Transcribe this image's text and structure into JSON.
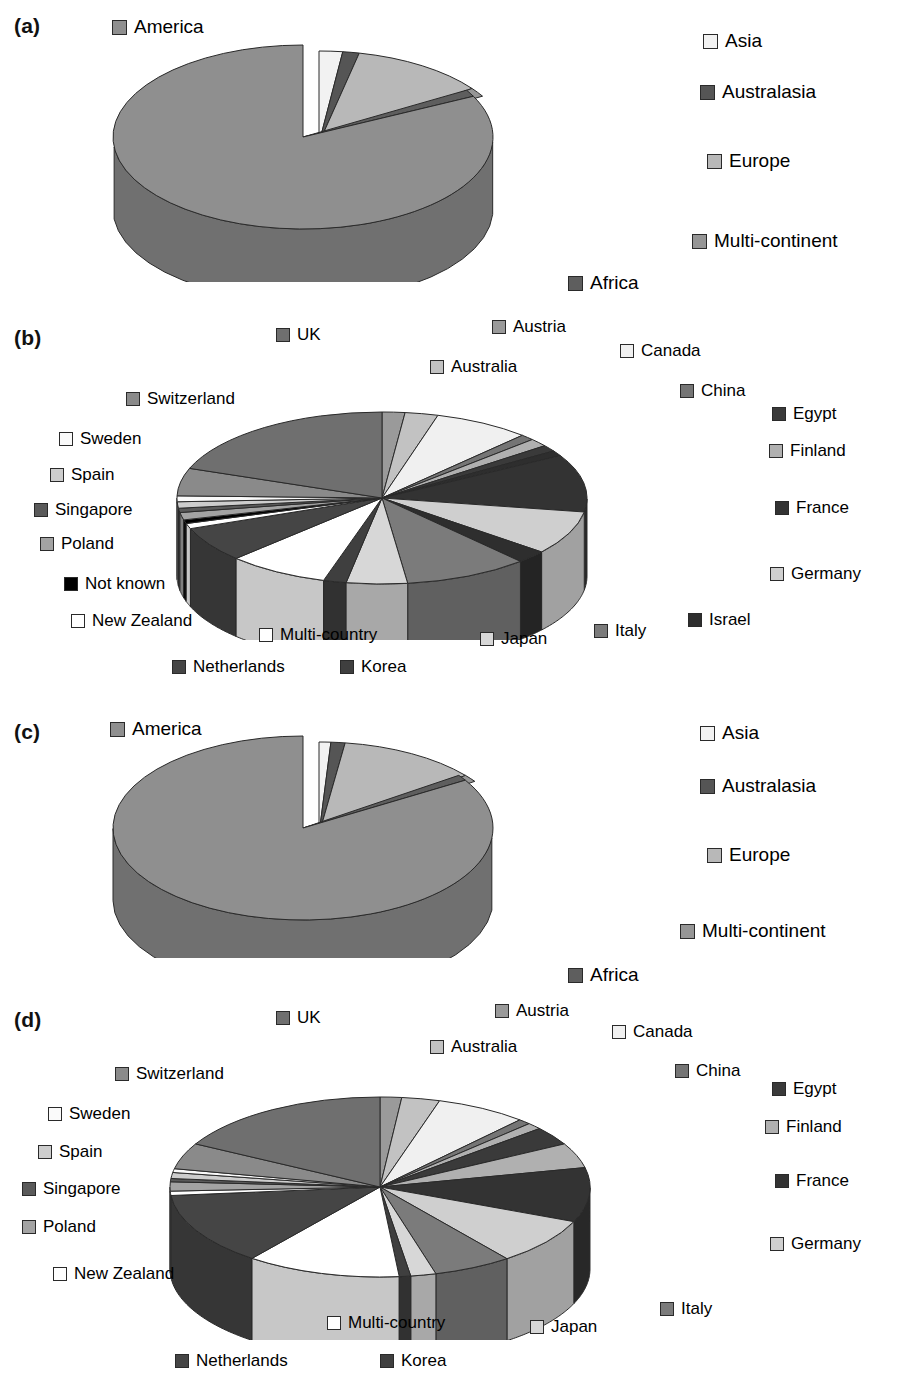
{
  "figure": {
    "panels": [
      "(a)",
      "(b)",
      "(c)",
      "(d)"
    ]
  },
  "palette": {
    "america": "#8f8f8f",
    "asia": "#f2f2f2",
    "australasia": "#555555",
    "europe": "#b8b8b8",
    "multi_continent": "#969696",
    "africa": "#5e5e5e",
    "uk": "#6f6f6f",
    "austria": "#9a9a9a",
    "australia": "#c2c2c2",
    "canada": "#f0f0f0",
    "china": "#757575",
    "egypt": "#3a3a3a",
    "finland": "#b0b0b0",
    "france": "#333333",
    "germany": "#cfcfcf",
    "israel": "#2e2e2e",
    "italy": "#7b7b7b",
    "japan": "#d7d7d7",
    "korea": "#3f3f3f",
    "netherlands": "#454545",
    "multi_country": "#ffffff",
    "new_zealand": "#ffffff",
    "not_known": "#000000",
    "poland": "#a3a3a3",
    "singapore": "#5a5a5a",
    "spain": "#cdcdcd",
    "sweden": "#fafafa",
    "switzerland": "#8a8a8a",
    "stroke": "#2a2a2a"
  },
  "chart_data": [
    {
      "id": "a",
      "type": "pie",
      "title": "(a)",
      "three_d": true,
      "exploded": [
        "Europe"
      ],
      "categories": [
        "America",
        "Asia",
        "Australasia",
        "Europe",
        "Multi-continent",
        "Africa"
      ],
      "values": [
        83.5,
        1.6,
        1.2,
        11.0,
        1.6,
        1.1
      ],
      "legend_position": "around",
      "legend": [
        {
          "label": "America",
          "color": "#8f8f8f"
        },
        {
          "label": "Asia",
          "color": "#f2f2f2"
        },
        {
          "label": "Australasia",
          "color": "#555555"
        },
        {
          "label": "Europe",
          "color": "#b8b8b8"
        },
        {
          "label": "Multi-continent",
          "color": "#969696"
        },
        {
          "label": "Africa",
          "color": "#5e5e5e"
        }
      ]
    },
    {
      "id": "b",
      "type": "pie",
      "title": "(b)",
      "three_d": true,
      "exploded": [],
      "categories": [
        "Austria",
        "Australia",
        "Canada",
        "China",
        "Egypt",
        "Finland",
        "France",
        "Germany",
        "Israel",
        "Italy",
        "Japan",
        "Korea",
        "Multi-country",
        "Netherlands",
        "New Zealand",
        "Not known",
        "Poland",
        "Singapore",
        "Spain",
        "Sweden",
        "Switzerland",
        "UK"
      ],
      "values": [
        1.8,
        2.6,
        8.0,
        1.1,
        1.7,
        1.5,
        11.5,
        8.5,
        2.2,
        9.5,
        5.0,
        1.8,
        8.0,
        6.5,
        1.0,
        0.7,
        1.4,
        0.8,
        1.2,
        1.1,
        5.2,
        17.9
      ],
      "legend_position": "around",
      "legend": [
        {
          "label": "UK",
          "color": "#6f6f6f"
        },
        {
          "label": "Austria",
          "color": "#9a9a9a"
        },
        {
          "label": "Australia",
          "color": "#c2c2c2"
        },
        {
          "label": "Canada",
          "color": "#f0f0f0"
        },
        {
          "label": "China",
          "color": "#757575"
        },
        {
          "label": "Egypt",
          "color": "#3a3a3a"
        },
        {
          "label": "Finland",
          "color": "#b0b0b0"
        },
        {
          "label": "France",
          "color": "#333333"
        },
        {
          "label": "Germany",
          "color": "#cfcfcf"
        },
        {
          "label": "Israel",
          "color": "#2e2e2e"
        },
        {
          "label": "Italy",
          "color": "#7b7b7b"
        },
        {
          "label": "Japan",
          "color": "#d7d7d7"
        },
        {
          "label": "Korea",
          "color": "#3f3f3f"
        },
        {
          "label": "Netherlands",
          "color": "#454545"
        },
        {
          "label": "Multi-country",
          "color": "#ffffff"
        },
        {
          "label": "New Zealand",
          "color": "#ffffff"
        },
        {
          "label": "Not known",
          "color": "#000000"
        },
        {
          "label": "Poland",
          "color": "#a3a3a3"
        },
        {
          "label": "Singapore",
          "color": "#5a5a5a"
        },
        {
          "label": "Spain",
          "color": "#cdcdcd"
        },
        {
          "label": "Sweden",
          "color": "#fafafa"
        },
        {
          "label": "Switzerland",
          "color": "#8a8a8a"
        }
      ]
    },
    {
      "id": "c",
      "type": "pie",
      "title": "(c)",
      "three_d": true,
      "exploded": [
        "Europe"
      ],
      "categories": [
        "America",
        "Asia",
        "Australasia",
        "Europe",
        "Multi-continent",
        "Africa"
      ],
      "values": [
        84.5,
        0.9,
        1.0,
        11.3,
        1.3,
        1.0
      ],
      "legend_position": "around",
      "legend": [
        {
          "label": "America",
          "color": "#8f8f8f"
        },
        {
          "label": "Asia",
          "color": "#f2f2f2"
        },
        {
          "label": "Australasia",
          "color": "#555555"
        },
        {
          "label": "Europe",
          "color": "#b8b8b8"
        },
        {
          "label": "Multi-continent",
          "color": "#969696"
        },
        {
          "label": "Africa",
          "color": "#5e5e5e"
        }
      ]
    },
    {
      "id": "d",
      "type": "pie",
      "title": "(d)",
      "three_d": true,
      "exploded": [],
      "categories": [
        "Austria",
        "Australia",
        "Canada",
        "China",
        "Egypt",
        "Finland",
        "France",
        "Germany",
        "Italy",
        "Japan",
        "Korea",
        "Multi-country",
        "Netherlands",
        "New Zealand",
        "Poland",
        "Singapore",
        "Spain",
        "Sweden",
        "Switzerland",
        "UK"
      ],
      "values": [
        1.7,
        3.0,
        7.5,
        1.0,
        3.5,
        4.8,
        10.0,
        8.5,
        6.0,
        2.0,
        0.9,
        11.0,
        13.0,
        0.8,
        1.6,
        0.6,
        1.1,
        0.7,
        4.8,
        17.5
      ],
      "legend_position": "around",
      "legend": [
        {
          "label": "UK",
          "color": "#6f6f6f"
        },
        {
          "label": "Austria",
          "color": "#9a9a9a"
        },
        {
          "label": "Australia",
          "color": "#c2c2c2"
        },
        {
          "label": "Canada",
          "color": "#f0f0f0"
        },
        {
          "label": "China",
          "color": "#757575"
        },
        {
          "label": "Egypt",
          "color": "#3a3a3a"
        },
        {
          "label": "Finland",
          "color": "#b0b0b0"
        },
        {
          "label": "France",
          "color": "#333333"
        },
        {
          "label": "Germany",
          "color": "#cfcfcf"
        },
        {
          "label": "Italy",
          "color": "#7b7b7b"
        },
        {
          "label": "Japan",
          "color": "#d7d7d7"
        },
        {
          "label": "Korea",
          "color": "#3f3f3f"
        },
        {
          "label": "Netherlands",
          "color": "#454545"
        },
        {
          "label": "Multi-country",
          "color": "#ffffff"
        },
        {
          "label": "New Zealand",
          "color": "#ffffff"
        },
        {
          "label": "Poland",
          "color": "#a3a3a3"
        },
        {
          "label": "Singapore",
          "color": "#5a5a5a"
        },
        {
          "label": "Spain",
          "color": "#cdcdcd"
        },
        {
          "label": "Sweden",
          "color": "#fafafa"
        },
        {
          "label": "Switzerland",
          "color": "#8a8a8a"
        }
      ]
    }
  ],
  "panel_a": {
    "label": "(a)",
    "legends": {
      "america": "America",
      "asia": "Asia",
      "australasia": "Australasia",
      "europe": "Europe",
      "multi_continent": "Multi-continent",
      "africa": "Africa"
    }
  },
  "panel_b": {
    "label": "(b)",
    "legends": {
      "uk": "UK",
      "austria": "Austria",
      "australia": "Australia",
      "canada": "Canada",
      "china": "China",
      "egypt": "Egypt",
      "finland": "Finland",
      "france": "France",
      "germany": "Germany",
      "israel": "Israel",
      "italy": "Italy",
      "japan": "Japan",
      "korea": "Korea",
      "netherlands": "Netherlands",
      "multi_country": "Multi-country",
      "new_zealand": "New Zealand",
      "not_known": "Not known",
      "poland": "Poland",
      "singapore": "Singapore",
      "spain": "Spain",
      "sweden": "Sweden",
      "switzerland": "Switzerland"
    }
  },
  "panel_c": {
    "label": "(c)",
    "legends": {
      "america": "America",
      "asia": "Asia",
      "australasia": "Australasia",
      "europe": "Europe",
      "multi_continent": "Multi-continent",
      "africa": "Africa"
    }
  },
  "panel_d": {
    "label": "(d)",
    "legends": {
      "uk": "UK",
      "austria": "Austria",
      "australia": "Australia",
      "canada": "Canada",
      "china": "China",
      "egypt": "Egypt",
      "finland": "Finland",
      "france": "France",
      "germany": "Germany",
      "italy": "Italy",
      "japan": "Japan",
      "korea": "Korea",
      "netherlands": "Netherlands",
      "multi_country": "Multi-country",
      "new_zealand": "New Zealand",
      "poland": "Poland",
      "singapore": "Singapore",
      "spain": "Spain",
      "sweden": "Sweden",
      "switzerland": "Switzerland"
    }
  }
}
